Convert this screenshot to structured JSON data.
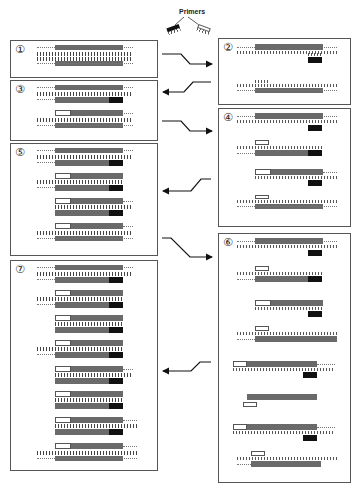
{
  "header": {
    "label": "Primers",
    "primer_icons": [
      "forward-primer-dark",
      "reverse-primer-light"
    ]
  },
  "colors": {
    "target": "#6a6a6a",
    "primer_forward": "#111111",
    "primer_reverse": "#ffffff",
    "border": "#555555"
  },
  "steps": [
    {
      "id": "1",
      "label": "①",
      "box": [
        10,
        40,
        148,
        38
      ],
      "duplexes": 1
    },
    {
      "id": "2",
      "label": "②",
      "box": [
        218,
        38,
        133,
        67
      ],
      "duplexes": 2
    },
    {
      "id": "3",
      "label": "③",
      "box": [
        10,
        80,
        148,
        61
      ],
      "duplexes": 2
    },
    {
      "id": "4",
      "label": "④",
      "box": [
        218,
        108,
        133,
        119
      ],
      "duplexes": 4
    },
    {
      "id": "5",
      "label": "⑤",
      "box": [
        10,
        143,
        148,
        113
      ],
      "duplexes": 4
    },
    {
      "id": "6",
      "label": "⑥",
      "box": [
        218,
        233,
        133,
        250
      ],
      "duplexes": 8
    },
    {
      "id": "7",
      "label": "⑦",
      "box": [
        10,
        260,
        148,
        211
      ],
      "duplexes": 8
    }
  ],
  "arrows": [
    {
      "from": "1",
      "to": "2"
    },
    {
      "from": "2",
      "to": "3"
    },
    {
      "from": "3",
      "to": "4"
    },
    {
      "from": "4",
      "to": "5"
    },
    {
      "from": "5",
      "to": "6"
    },
    {
      "from": "6",
      "to": "7"
    }
  ]
}
